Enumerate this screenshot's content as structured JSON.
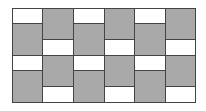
{
  "diagram": {
    "colors": {
      "shaded": "#a9a9a9",
      "blank": "#ffffff",
      "line": "#444444"
    },
    "columns": 6,
    "column_x": [
      12,
      42,
      73,
      104,
      134,
      165,
      195
    ],
    "top": 8,
    "bottom": 102,
    "odd_column_segments": [
      {
        "y0": 8,
        "y1": 23,
        "fill": "blank"
      },
      {
        "y0": 23,
        "y1": 55,
        "fill": "shaded"
      },
      {
        "y0": 55,
        "y1": 70,
        "fill": "blank"
      },
      {
        "y0": 70,
        "y1": 102,
        "fill": "shaded"
      }
    ],
    "even_column_segments": [
      {
        "y0": 8,
        "y1": 39,
        "fill": "shaded"
      },
      {
        "y0": 39,
        "y1": 55,
        "fill": "blank"
      },
      {
        "y0": 55,
        "y1": 86,
        "fill": "shaded"
      },
      {
        "y0": 86,
        "y1": 102,
        "fill": "blank"
      }
    ]
  }
}
